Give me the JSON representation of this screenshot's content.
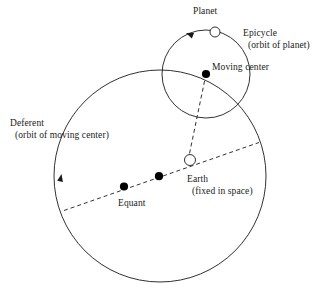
{
  "diagram": {
    "stroke_color": "#1a1a1a",
    "fill_color": "#ffffff",
    "background": "#ffffff",
    "labels": {
      "planet": "Planet",
      "epicycle": "Epicycle",
      "epicycle_sub": "(orbit of planet)",
      "moving_center": "Moving center",
      "deferent": "Deferent",
      "deferent_sub": "(orbit of moving center)",
      "earth": "Earth",
      "earth_sub": "(fixed in space)",
      "equant": "Equant"
    },
    "elements": [
      {
        "name": "deferent-circle",
        "type": "circle",
        "cx": 160,
        "cy": 176,
        "r": 106,
        "style": "solid"
      },
      {
        "name": "epicycle-circle",
        "type": "circle",
        "cx": 206,
        "cy": 74,
        "r": 44,
        "style": "solid"
      },
      {
        "name": "planet-marker",
        "type": "open-circle",
        "cx": 215,
        "cy": 32,
        "r": 5
      },
      {
        "name": "earth-marker",
        "type": "open-circle",
        "cx": 190,
        "cy": 160,
        "r": 5.5
      },
      {
        "name": "moving-center-marker",
        "type": "filled-dot",
        "cx": 206,
        "cy": 74,
        "r": 4
      },
      {
        "name": "deferent-center-marker",
        "type": "filled-dot",
        "cx": 159,
        "cy": 176,
        "r": 4
      },
      {
        "name": "equant-marker",
        "type": "filled-dot",
        "cx": 124,
        "cy": 186,
        "r": 4
      },
      {
        "name": "apsidal-line",
        "type": "dashed-line",
        "x1": 65,
        "y1": 210,
        "x2": 258,
        "y2": 143
      },
      {
        "name": "radius-line",
        "type": "dashed-line",
        "x1": 206,
        "y1": 74,
        "x2": 190,
        "y2": 160
      },
      {
        "name": "epicycle-direction-arrow",
        "type": "arrowhead",
        "x": 186,
        "y": 33,
        "angle": 205
      },
      {
        "name": "deferent-direction-arrow",
        "type": "arrowhead",
        "x": 61,
        "y": 176,
        "angle": 280
      }
    ]
  }
}
